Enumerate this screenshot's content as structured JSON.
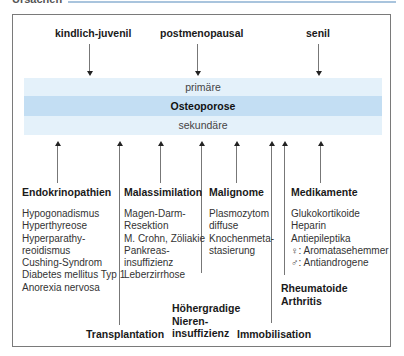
{
  "header": {
    "title": "Ursachen",
    "accent_color": "#a9c4dd"
  },
  "top_labels": [
    "kindlich-juvenil",
    "postmenopausal",
    "senil"
  ],
  "bands": {
    "primary": "primäre",
    "center": "Osteoporose",
    "secondary": "sekundäre"
  },
  "categories": [
    {
      "title": "Endokrinopathien",
      "items": [
        "Hypogonadismus",
        "Hyperthyreose",
        "Hyperparathy-",
        "reoidismus",
        "Cushing-Syndrom",
        "Diabetes mellitus Typ 1",
        "Anorexia nervosa"
      ]
    },
    {
      "title": "Malassimilation",
      "items": [
        "Magen-Darm-",
        "Resektion",
        "M. Crohn, Zöliakie",
        "Pankreas-",
        "insuffizienz",
        "Leberzirrhose"
      ]
    },
    {
      "title": "Malignome",
      "items": [
        "Plasmozytom",
        "diffuse",
        "Knochenmeta-",
        "stasierung"
      ]
    },
    {
      "title": "Medikamente",
      "items": [
        "Glukokortikoide",
        "Heparin",
        "Antiepileptika",
        "♀: Aromatasehemmer",
        "♂: Antiandrogene"
      ]
    }
  ],
  "bottom_labels": {
    "transplantation": "Transplantation",
    "niere": [
      "Höhergradige",
      "Nieren-",
      "insuffizienz"
    ],
    "immobilisation": "Immobilisation",
    "rheuma": [
      "Rheumatoide",
      "Arthritis"
    ]
  },
  "colors": {
    "band_light": "#e4f1fa",
    "band_dark": "#c3def3",
    "border": "#7a7a7a"
  }
}
